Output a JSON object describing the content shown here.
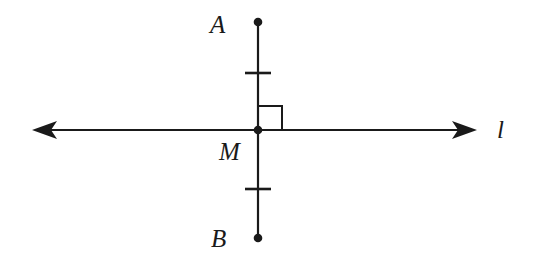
{
  "figure": {
    "kind": "geometry-diagram",
    "width": 535,
    "height": 267,
    "background_color": "#ffffff",
    "stroke_color": "#1a1a1a",
    "stroke_width": 2,
    "labels": {
      "point_a": "A",
      "point_m": "M",
      "point_b": "B",
      "line_l": "l"
    },
    "geometry": {
      "line_l": {
        "name": "line-l",
        "y": 130,
        "x_start": 32,
        "x_end": 477,
        "arrowheads": "both"
      },
      "segment_ab": {
        "name": "segment-ab",
        "x": 258,
        "y_top": 22,
        "y_bottom": 238,
        "endpoints": "dots"
      },
      "points": [
        {
          "name": "A",
          "x": 258,
          "y": 22
        },
        {
          "name": "M",
          "x": 258,
          "y": 130
        },
        {
          "name": "B",
          "x": 258,
          "y": 238
        }
      ],
      "right_angle_marker": {
        "name": "right-angle-marker",
        "quadrant": "upper-right",
        "x": 258,
        "y": 130,
        "size": 24
      },
      "congruence_ticks": [
        {
          "name": "tick-upper",
          "x": 258,
          "y": 73,
          "half_width": 13
        },
        {
          "name": "tick-lower",
          "x": 258,
          "y": 189,
          "half_width": 13
        }
      ]
    }
  }
}
